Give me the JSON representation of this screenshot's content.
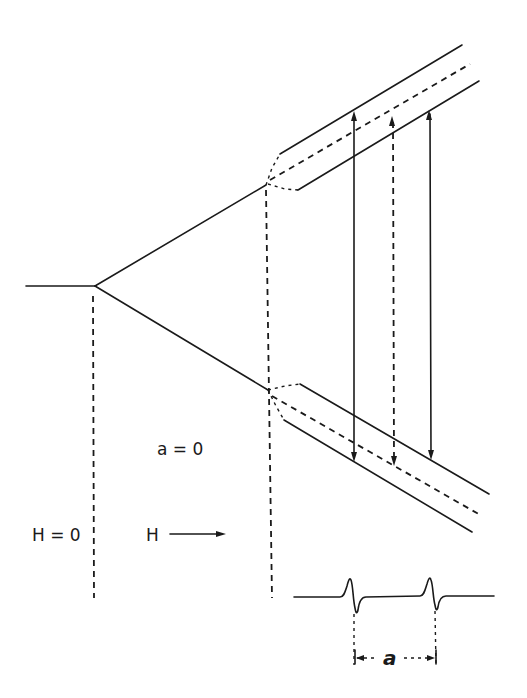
{
  "diagram": {
    "labels": {
      "zero_field": "H = 0",
      "field_axis": "H",
      "no_coupling": "a = 0",
      "coupling_constant": "a"
    },
    "regions": [
      {
        "name": "zero-field",
        "description": "single degenerate level"
      },
      {
        "name": "zeeman",
        "description": "level splits into two Zeeman levels with increasing H"
      },
      {
        "name": "hyperfine",
        "description": "each Zeeman level splits into two hyperfine sublevels (solid) with unshifted reference (dashed)"
      }
    ],
    "transitions": [
      {
        "style": "solid",
        "type": "allowed"
      },
      {
        "style": "dashed",
        "type": "reference (a = 0)"
      },
      {
        "style": "solid",
        "type": "allowed"
      }
    ],
    "spectrum": {
      "lines": 2,
      "shape": "first-derivative absorption",
      "spacing_label": "a"
    },
    "colors": {
      "ink": "#1a1a1a",
      "background": "#ffffff"
    }
  }
}
